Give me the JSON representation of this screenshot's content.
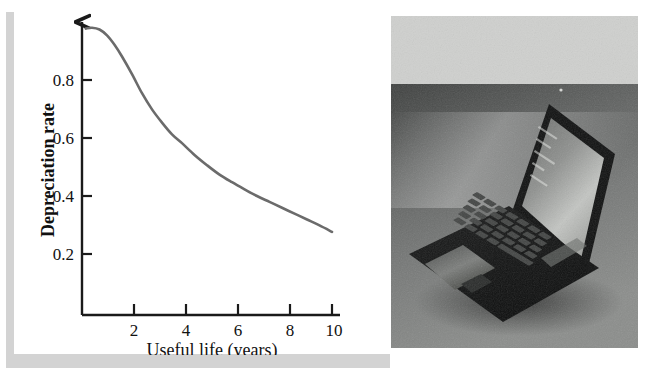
{
  "figure": {
    "layout": "two-panel figure: line chart on the left, grayscale photograph on the right",
    "background_color": "#ffffff",
    "rule_color": "#d3d3d3",
    "curve_color": "#6b6b6b",
    "axis_color": "#1a1a1a",
    "text_color": "#111111"
  },
  "decoration": {
    "vertical_rule_name": "vertical-gray-rule",
    "horizontal_rule_name": "horizontal-gray-rule"
  },
  "chart_data": {
    "type": "line",
    "title": "",
    "subtitle": "",
    "xlabel": "Useful life (years)",
    "ylabel": "Depreciation rate",
    "xlim": [
      0,
      10.6
    ],
    "ylim": [
      0,
      1.0
    ],
    "grid": false,
    "legend": null,
    "legend_position": "none",
    "x_ticks": [
      2,
      4,
      6,
      8,
      10
    ],
    "x_tick_labels": [
      "2",
      "4",
      "6",
      "8",
      "10"
    ],
    "y_ticks": [
      0.2,
      0.4,
      0.6,
      0.8
    ],
    "y_tick_labels": [
      "0.2",
      "0.4",
      "0.6",
      "0.8"
    ],
    "y_axis_has_arrow": true,
    "series": [
      {
        "name": "Depreciation rate",
        "color": "#6b6b6b",
        "x": [
          0.15,
          0.4,
          0.7,
          1.0,
          1.3,
          1.6,
          2.0,
          2.4,
          2.8,
          3.2,
          3.6,
          4.0,
          4.5,
          5.0,
          5.5,
          6.0,
          6.5,
          7.0,
          7.5,
          8.0,
          8.5,
          9.0,
          9.5,
          10.0
        ],
        "y": [
          0.975,
          0.978,
          0.972,
          0.952,
          0.92,
          0.88,
          0.82,
          0.755,
          0.7,
          0.655,
          0.615,
          0.585,
          0.545,
          0.51,
          0.478,
          0.452,
          0.428,
          0.405,
          0.385,
          0.365,
          0.345,
          0.325,
          0.305,
          0.283
        ]
      }
    ],
    "annotations": []
  },
  "photo": {
    "alt": "Grayscale photograph of an open laptop computer resting on a surface, viewed from an angle with the screen tilted back",
    "subject": "laptop-computer",
    "palette": {
      "top_band": "#cfd0ce",
      "background_dark": "#4d4f4e",
      "background_mid": "#6d6f6e",
      "body_black": "#151616",
      "screen_glow": "#b9bbb8",
      "keyboard_key": "#3c3d3d"
    }
  }
}
